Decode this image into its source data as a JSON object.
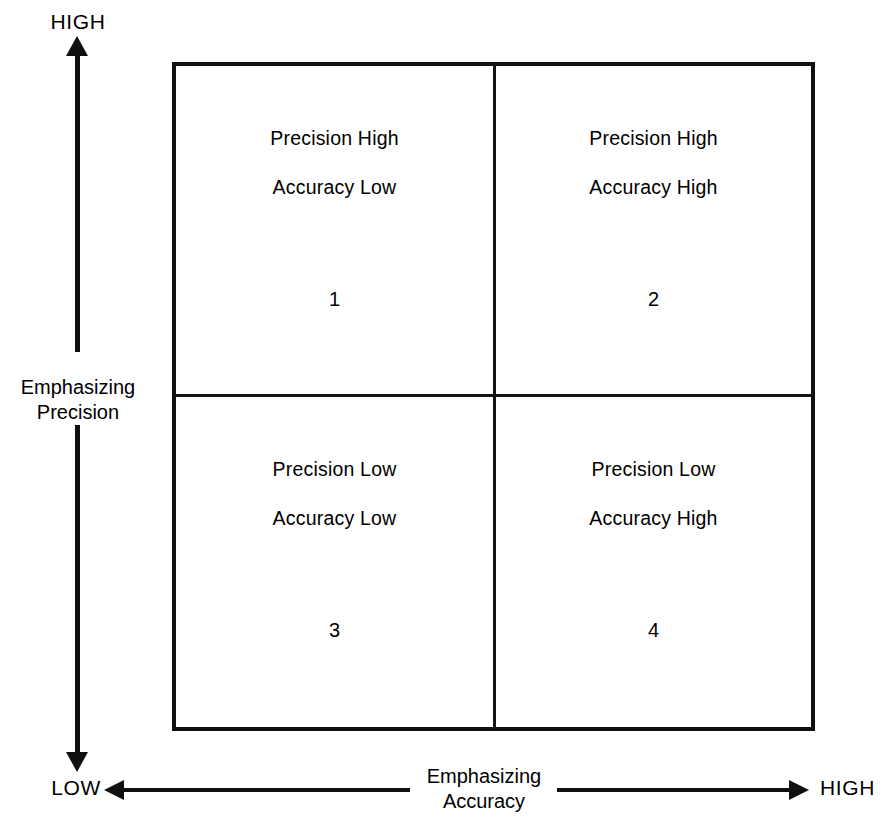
{
  "diagram": {
    "type": "2x2-matrix",
    "axes": {
      "vertical": {
        "label_line1": "Emphasizing",
        "label_line2": "Precision",
        "high_label": "HIGH",
        "low_label": "LOW"
      },
      "horizontal": {
        "label_line1": "Emphasizing",
        "label_line2": "Accuracy",
        "low_label": "LOW",
        "high_label": "HIGH"
      }
    },
    "quadrants": [
      {
        "id": "1",
        "position": "top-left",
        "line1": "Precision High",
        "line2": "Accuracy Low",
        "number": "1"
      },
      {
        "id": "2",
        "position": "top-right",
        "line1": "Precision High",
        "line2": "Accuracy High",
        "number": "2"
      },
      {
        "id": "3",
        "position": "bottom-left",
        "line1": "Precision Low",
        "line2": "Accuracy Low",
        "number": "3"
      },
      {
        "id": "4",
        "position": "bottom-right",
        "line1": "Precision Low",
        "line2": "Accuracy High",
        "number": "4"
      }
    ],
    "colors": {
      "background": "#ffffff",
      "ink": "#101010"
    }
  }
}
